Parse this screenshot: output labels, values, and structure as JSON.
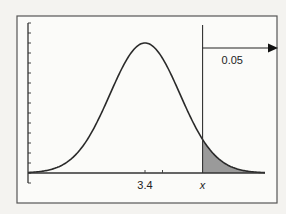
{
  "chart_data": {
    "type": "area",
    "title": "",
    "distribution": "normal",
    "mean": 3.4,
    "std_dev": 1,
    "xlabel": "",
    "ylabel": "",
    "x_tick_labels": [
      {
        "value": 3.4,
        "label": "3.4"
      },
      {
        "value": 5.045,
        "label": "x"
      }
    ],
    "x_minor_ticks": [
      3.4,
      3.9
    ],
    "xlim": [
      -0.8,
      7.5
    ],
    "grid": false,
    "shaded_region": {
      "from": 5.045,
      "to": "inf",
      "tail": "right",
      "area": 0.05
    },
    "annotation": {
      "text": "0.05",
      "arrow": "right"
    },
    "colors": {
      "curve": "#2a2a2a",
      "shade": "#9a9a9a",
      "frame": "#555555"
    }
  }
}
